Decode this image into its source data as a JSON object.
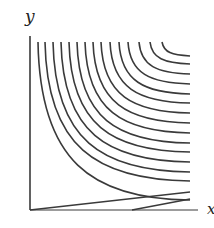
{
  "chart_data": {
    "type": "contour",
    "title": "",
    "xlabel": "x",
    "ylabel": "y",
    "grid": false,
    "legend": null,
    "axes": {
      "origin_px": [
        30,
        210
      ],
      "y_axis_top_px": 36,
      "x_axis_right_px": 198
    },
    "curves_px": [
      {
        "top_x": 38,
        "right_y": 200
      },
      {
        "top_x": 45,
        "right_y": 181
      },
      {
        "top_x": 53,
        "right_y": 172
      },
      {
        "top_x": 61,
        "right_y": 162
      },
      {
        "top_x": 69,
        "right_y": 152
      },
      {
        "top_x": 77,
        "right_y": 143
      },
      {
        "top_x": 85,
        "right_y": 133
      },
      {
        "top_x": 93,
        "right_y": 123
      },
      {
        "top_x": 101,
        "right_y": 113
      },
      {
        "top_x": 110,
        "right_y": 103
      },
      {
        "top_x": 119,
        "right_y": 94
      },
      {
        "top_x": 128,
        "right_y": 84
      },
      {
        "top_x": 139,
        "right_y": 74
      },
      {
        "top_x": 150,
        "right_y": 64
      },
      {
        "top_x": 162,
        "right_y": 56
      }
    ],
    "straight_lines_px": [
      {
        "from": [
          30,
          210
        ],
        "to": [
          190,
          192
        ]
      },
      {
        "from": [
          132,
          210
        ],
        "to": [
          190,
          199
        ]
      }
    ]
  },
  "labels": {
    "y_axis": "y",
    "x_axis": "x"
  },
  "colors": {
    "stroke": "#3a3a3a",
    "background": "#ffffff"
  }
}
